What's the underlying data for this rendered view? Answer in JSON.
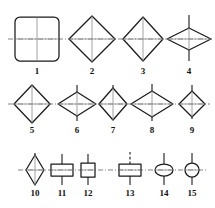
{
  "figure": {
    "background_color": "#ffffff",
    "outline_color": "#1a1a1a",
    "centerline_color": "#6e6e6e",
    "label_color": "#111111",
    "rows": 3,
    "item_count": 15
  },
  "chart_data": {
    "type": "diagram",
    "xlabel": "",
    "ylabel": "",
    "rows": [
      {
        "row_index": 1,
        "centerline_y": 39,
        "items": [
          "1",
          "2",
          "3",
          "4"
        ]
      },
      {
        "row_index": 2,
        "centerline_y": 104,
        "items": [
          "5",
          "6",
          "7",
          "8",
          "9"
        ]
      },
      {
        "row_index": 3,
        "centerline_y": 170,
        "items": [
          "10",
          "11",
          "12",
          "13",
          "14",
          "15"
        ]
      }
    ],
    "items": [
      {
        "label": "1",
        "shape": "rounded-square",
        "row": 1,
        "cx": 37,
        "cy": 39,
        "half_width": 22,
        "half_height": 22,
        "corner_radius": 5,
        "stem_up": 22,
        "stem_down": 22,
        "has_horizontal_axis": true,
        "has_vertical_axis": true,
        "stem_style": "solid",
        "label_x": 37,
        "label_y": 74
      },
      {
        "label": "2",
        "shape": "diamond",
        "row": 1,
        "cx": 92,
        "cy": 39,
        "half_width": 23,
        "half_height": 23,
        "stem_up": 22,
        "stem_down": 22,
        "has_horizontal_axis": true,
        "has_vertical_axis": true,
        "stem_style": "solid",
        "label_x": 92,
        "label_y": 74
      },
      {
        "label": "3",
        "shape": "diamond",
        "row": 1,
        "cx": 143,
        "cy": 39,
        "half_width": 20,
        "half_height": 22,
        "stem_up": 22,
        "stem_down": 22,
        "has_horizontal_axis": true,
        "has_vertical_axis": true,
        "stem_style": "solid",
        "label_x": 143,
        "label_y": 74
      },
      {
        "label": "4",
        "shape": "diamond",
        "row": 1,
        "cx": 189,
        "cy": 39,
        "half_width": 22,
        "half_height": 11,
        "stem_up": 24,
        "stem_down": 22,
        "has_horizontal_axis": true,
        "has_vertical_axis": true,
        "stem_style": "solid",
        "label_x": 189,
        "label_y": 74
      },
      {
        "label": "5",
        "shape": "diamond",
        "row": 2,
        "cx": 32,
        "cy": 104,
        "half_width": 18,
        "half_height": 19,
        "stem_up": 18,
        "stem_down": 18,
        "has_horizontal_axis": true,
        "has_vertical_axis": true,
        "stem_style": "solid",
        "label_x": 32,
        "label_y": 133
      },
      {
        "label": "6",
        "shape": "diamond",
        "row": 2,
        "cx": 77,
        "cy": 104,
        "half_width": 19,
        "half_height": 12,
        "stem_up": 19,
        "stem_down": 17,
        "has_horizontal_axis": true,
        "has_vertical_axis": true,
        "stem_style": "solid",
        "label_x": 77,
        "label_y": 133
      },
      {
        "label": "7",
        "shape": "diamond",
        "row": 2,
        "cx": 113,
        "cy": 104,
        "half_width": 14,
        "half_height": 16,
        "stem_up": 19,
        "stem_down": 16,
        "has_horizontal_axis": true,
        "has_vertical_axis": true,
        "stem_style": "solid",
        "label_x": 113,
        "label_y": 133
      },
      {
        "label": "8",
        "shape": "diamond",
        "row": 2,
        "cx": 152,
        "cy": 104,
        "half_width": 21,
        "half_height": 13,
        "stem_up": 20,
        "stem_down": 17,
        "has_horizontal_axis": true,
        "has_vertical_axis": true,
        "stem_style": "solid",
        "label_x": 152,
        "label_y": 133
      },
      {
        "label": "9",
        "shape": "diamond",
        "row": 2,
        "cx": 192,
        "cy": 104,
        "half_width": 13,
        "half_height": 13,
        "stem_up": 19,
        "stem_down": 15,
        "has_horizontal_axis": true,
        "has_vertical_axis": true,
        "stem_style": "solid",
        "label_x": 192,
        "label_y": 133
      },
      {
        "label": "10",
        "shape": "diamond",
        "row": 3,
        "cx": 35,
        "cy": 170,
        "half_width": 9,
        "half_height": 15,
        "stem_up": 17,
        "stem_down": 15,
        "has_horizontal_axis": true,
        "has_vertical_axis": true,
        "stem_style": "solid",
        "label_x": 35,
        "label_y": 196
      },
      {
        "label": "11",
        "shape": "rectangle",
        "row": 3,
        "cx": 62,
        "cy": 170,
        "half_width": 11,
        "half_height": 6,
        "stem_up": 16,
        "stem_down": 15,
        "has_horizontal_axis": true,
        "has_vertical_axis": false,
        "stem_style": "solid",
        "label_x": 62,
        "label_y": 196
      },
      {
        "label": "12",
        "shape": "rectangle",
        "row": 3,
        "cx": 88,
        "cy": 170,
        "half_width": 7,
        "half_height": 7,
        "stem_up": 16,
        "stem_down": 15,
        "has_horizontal_axis": true,
        "has_vertical_axis": false,
        "stem_style": "solid",
        "label_x": 88,
        "label_y": 196
      },
      {
        "label": "13",
        "shape": "rectangle",
        "row": 3,
        "cx": 130,
        "cy": 170,
        "half_width": 11,
        "half_height": 6,
        "stem_up": 18,
        "stem_down": 15,
        "has_horizontal_axis": true,
        "has_vertical_axis": false,
        "stem_style": "dashed-up",
        "label_x": 130,
        "label_y": 196
      },
      {
        "label": "14",
        "shape": "ellipse",
        "row": 3,
        "cx": 164,
        "cy": 170,
        "half_width": 9,
        "half_height": 6,
        "stem_up": 17,
        "stem_down": 15,
        "has_horizontal_axis": true,
        "has_vertical_axis": false,
        "stem_style": "solid",
        "label_x": 164,
        "label_y": 196
      },
      {
        "label": "15",
        "shape": "circle",
        "row": 3,
        "cx": 192,
        "cy": 170,
        "half_width": 7,
        "half_height": 7,
        "stem_up": 17,
        "stem_down": 15,
        "has_horizontal_axis": true,
        "has_vertical_axis": false,
        "stem_style": "solid",
        "label_x": 192,
        "label_y": 196
      }
    ],
    "connectors": [
      {
        "row": 1,
        "x1": 8,
        "x2": 212,
        "y": 39,
        "style": "dash-dot"
      },
      {
        "row": 2,
        "x1": 8,
        "x2": 210,
        "y": 104,
        "style": "dash-dot"
      },
      {
        "row": 3,
        "x1": 18,
        "x2": 208,
        "y": 170,
        "style": "dash-dot"
      }
    ]
  }
}
